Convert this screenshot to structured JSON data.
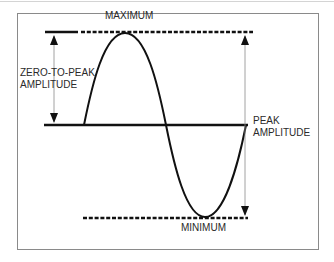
{
  "diagram": {
    "labels": {
      "maximum": "MAXIMUM",
      "minimum": "MINIMUM",
      "zero_to_peak_line1": "ZERO-TO-PEAK",
      "zero_to_peak_line2": "AMPLITUDE",
      "peak_line1": "PEAK",
      "peak_line2": "AMPLITUDE"
    },
    "colors": {
      "line": "#111111",
      "arrow": "#8c8c8c",
      "frame": "#8a8a8a",
      "text": "#2a2a2a"
    },
    "elements": [
      {
        "type": "reference-line",
        "name": "maximum-line",
        "style": "solid+dashed"
      },
      {
        "type": "reference-line",
        "name": "zero-line",
        "style": "solid"
      },
      {
        "type": "reference-line",
        "name": "minimum-line",
        "style": "dashed"
      },
      {
        "type": "waveform",
        "name": "sine-wave",
        "cycles": 1
      },
      {
        "type": "dimension-arrow",
        "name": "zero-to-peak-arrow",
        "from": "zero-line",
        "to": "maximum-line"
      },
      {
        "type": "dimension-arrow",
        "name": "peak-amplitude-arrow",
        "from": "minimum-line",
        "to": "maximum-line"
      }
    ]
  }
}
